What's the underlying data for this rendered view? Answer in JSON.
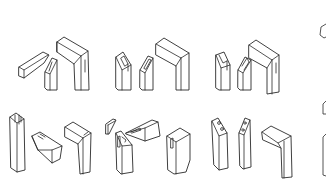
{
  "figure": {
    "background": "#ffffff",
    "line_color": "#2a2a2a",
    "rows": [
      {
        "label": "",
        "groups": [
          {
            "name": "bridle-joint-1",
            "parts": [
              "tenon-piece",
              "slotted-post",
              "assembled-corner"
            ]
          },
          {
            "name": "bridle-joint-2",
            "parts": [
              "notched-post-a",
              "notched-post-b",
              "assembled-corner"
            ]
          },
          {
            "name": "bridle-joint-3",
            "parts": [
              "double-tenon-post-a",
              "double-tenon-post-b",
              "assembled-corner"
            ]
          }
        ]
      },
      {
        "label": "",
        "groups": [
          {
            "name": "dovetail-joint",
            "parts": [
              "forked-post",
              "angled-tenon-block",
              "assembled-corner"
            ]
          },
          {
            "name": "wedge-joint",
            "parts": [
              "wedge",
              "slotted-block",
              "mortised-post",
              "assembled-corner"
            ]
          },
          {
            "name": "pinned-joint",
            "parts": [
              "pinned-post-a",
              "pinned-post-b",
              "mitered-corner"
            ]
          }
        ]
      }
    ]
  }
}
